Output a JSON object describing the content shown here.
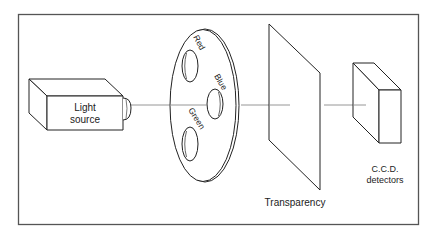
{
  "diagram": {
    "frame_color": "#555555",
    "line_color": "#222222",
    "beam_color": "#888888",
    "components": {
      "light_source": {
        "line1": "Light",
        "line2": "source"
      },
      "filter_wheel": {
        "filters": [
          {
            "label": "Red"
          },
          {
            "label": "Blue"
          },
          {
            "label": "Green"
          }
        ]
      },
      "transparency": {
        "label": "Transparency"
      },
      "detectors": {
        "line1": "C.C.D.",
        "line2": "detectors"
      }
    }
  }
}
